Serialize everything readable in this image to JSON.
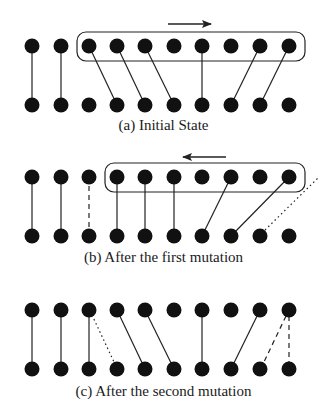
{
  "figure": {
    "node_color": "#111111",
    "line_color": "#222222",
    "node_count_per_row": 10,
    "panels": [
      {
        "id": "a",
        "caption": "(a) Initial State",
        "arrow_direction": "right",
        "window": {
          "from_node": 3,
          "to_node": 10
        },
        "edges": [
          {
            "top": 1,
            "bottom": 1,
            "style": "solid"
          },
          {
            "top": 2,
            "bottom": 2,
            "style": "solid"
          },
          {
            "top": 3,
            "bottom": 4,
            "style": "solid"
          },
          {
            "top": 4,
            "bottom": 5,
            "style": "solid"
          },
          {
            "top": 5,
            "bottom": 6,
            "style": "solid"
          },
          {
            "top": 7,
            "bottom": 7,
            "style": "solid"
          },
          {
            "top": 9,
            "bottom": 8,
            "style": "solid"
          },
          {
            "top": 10,
            "bottom": 9,
            "style": "solid"
          }
        ]
      },
      {
        "id": "b",
        "caption": "(b) After the first mutation",
        "arrow_direction": "left",
        "window": {
          "from_node": 4,
          "to_node": 10
        },
        "edges": [
          {
            "top": 1,
            "bottom": 1,
            "style": "solid"
          },
          {
            "top": 2,
            "bottom": 2,
            "style": "solid"
          },
          {
            "top": 3,
            "bottom": 3,
            "style": "dashed"
          },
          {
            "top": 4,
            "bottom": 4,
            "style": "solid"
          },
          {
            "top": 5,
            "bottom": 5,
            "style": "solid"
          },
          {
            "top": 6,
            "bottom": 6,
            "style": "solid"
          },
          {
            "top": 8,
            "bottom": 7,
            "style": "solid"
          },
          {
            "top": 10,
            "bottom": 8,
            "style": "solid"
          },
          {
            "top": "off-right",
            "bottom": 9,
            "style": "dotted"
          }
        ]
      },
      {
        "id": "c",
        "caption": "(c) After the second mutation",
        "arrow_direction": "none",
        "window": null,
        "edges": [
          {
            "top": 1,
            "bottom": 1,
            "style": "solid"
          },
          {
            "top": 2,
            "bottom": 2,
            "style": "solid"
          },
          {
            "top": 3,
            "bottom": 3,
            "style": "solid"
          },
          {
            "top": 3,
            "bottom": 4,
            "style": "dotted"
          },
          {
            "top": 4,
            "bottom": 5,
            "style": "solid"
          },
          {
            "top": 5,
            "bottom": 6,
            "style": "solid"
          },
          {
            "top": 7,
            "bottom": 7,
            "style": "solid"
          },
          {
            "top": 9,
            "bottom": 8,
            "style": "solid"
          },
          {
            "top": 10,
            "bottom": 9,
            "style": "dashed"
          },
          {
            "top": 10,
            "bottom": 10,
            "style": "dashed"
          }
        ]
      }
    ]
  }
}
